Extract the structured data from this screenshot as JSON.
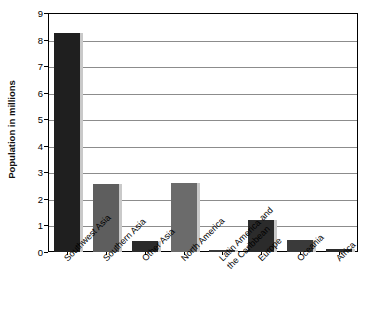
{
  "chart_data": {
    "type": "bar",
    "title": "",
    "xlabel": "",
    "ylabel": "Population in millions",
    "ylim": [
      0,
      9
    ],
    "yticks": [
      0,
      1,
      2,
      3,
      4,
      5,
      6,
      7,
      8,
      9
    ],
    "ytick_labels": [
      "0",
      "1",
      "2",
      "3",
      "4",
      "5",
      "6",
      "7",
      "8",
      "9"
    ],
    "grid": true,
    "legend": "none",
    "categories": [
      "Southwest Asia",
      "Southern Asia",
      "Other Asia",
      "North America",
      "Latin America and the Caribbean",
      "Europe",
      "Oceania",
      "Africa"
    ],
    "category_lines": [
      [
        "Southwest Asia"
      ],
      [
        "Southern Asia"
      ],
      [
        "Other Asia"
      ],
      [
        "North America"
      ],
      [
        "Latin America and",
        "the Caribbean"
      ],
      [
        "Europe"
      ],
      [
        "Oceania"
      ],
      [
        "Africa"
      ]
    ],
    "values": [
      8.25,
      2.55,
      0.42,
      2.6,
      0.04,
      1.22,
      0.45,
      0.1
    ],
    "bar_colors": [
      "#1f1f1f",
      "#5e5e5e",
      "#2b2b2b",
      "#6b6b6b",
      "#3a3a3a",
      "#2b2b2b",
      "#3a3a3a",
      "#2b2b2b"
    ]
  },
  "axis": {
    "y_title": "Population in millions"
  }
}
